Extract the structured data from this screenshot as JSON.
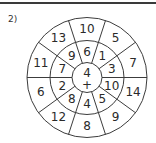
{
  "problem": {
    "label": "2)"
  },
  "wheel": {
    "center": {
      "x": 87,
      "y": 77.5
    },
    "radii": {
      "inner": 15,
      "middle": 37,
      "outer": 60
    },
    "line_color": "#3c3c3c",
    "spoke_angles_deg": [
      0,
      36,
      72,
      108,
      144,
      180,
      216,
      252,
      288,
      324
    ],
    "center_cell": {
      "number": "4",
      "operator": "+"
    },
    "middle_ring": [
      {
        "angle": 90,
        "value": "6"
      },
      {
        "angle": 54,
        "value": "1"
      },
      {
        "angle": 18,
        "value": "3"
      },
      {
        "angle": -18,
        "value": "10"
      },
      {
        "angle": -54,
        "value": "5"
      },
      {
        "angle": -90,
        "value": "4"
      },
      {
        "angle": -126,
        "value": "8"
      },
      {
        "angle": -162,
        "value": "2"
      },
      {
        "angle": 162,
        "value": "7"
      },
      {
        "angle": 126,
        "value": "9"
      }
    ],
    "outer_ring": [
      {
        "angle": 90,
        "value": "10"
      },
      {
        "angle": 54,
        "value": "5"
      },
      {
        "angle": 18,
        "value": "7"
      },
      {
        "angle": -18,
        "value": "14"
      },
      {
        "angle": -54,
        "value": "9"
      },
      {
        "angle": -90,
        "value": "8"
      },
      {
        "angle": -126,
        "value": "12"
      },
      {
        "angle": -162,
        "value": "6"
      },
      {
        "angle": 162,
        "value": "11"
      },
      {
        "angle": 126,
        "value": "13"
      }
    ]
  }
}
